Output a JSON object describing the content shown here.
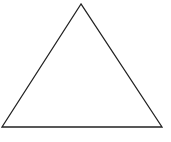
{
  "diagram": {
    "shape": "triangle",
    "style": {
      "stroke": "#222222",
      "fill": "#ffffff",
      "stroke_width": 1.3,
      "background": "#ffffff"
    },
    "vertices": [
      {
        "name": "apex",
        "x": 81,
        "y": 4
      },
      {
        "name": "bottom-left",
        "x": 2,
        "y": 127
      },
      {
        "name": "bottom-right",
        "x": 162,
        "y": 127
      }
    ]
  }
}
